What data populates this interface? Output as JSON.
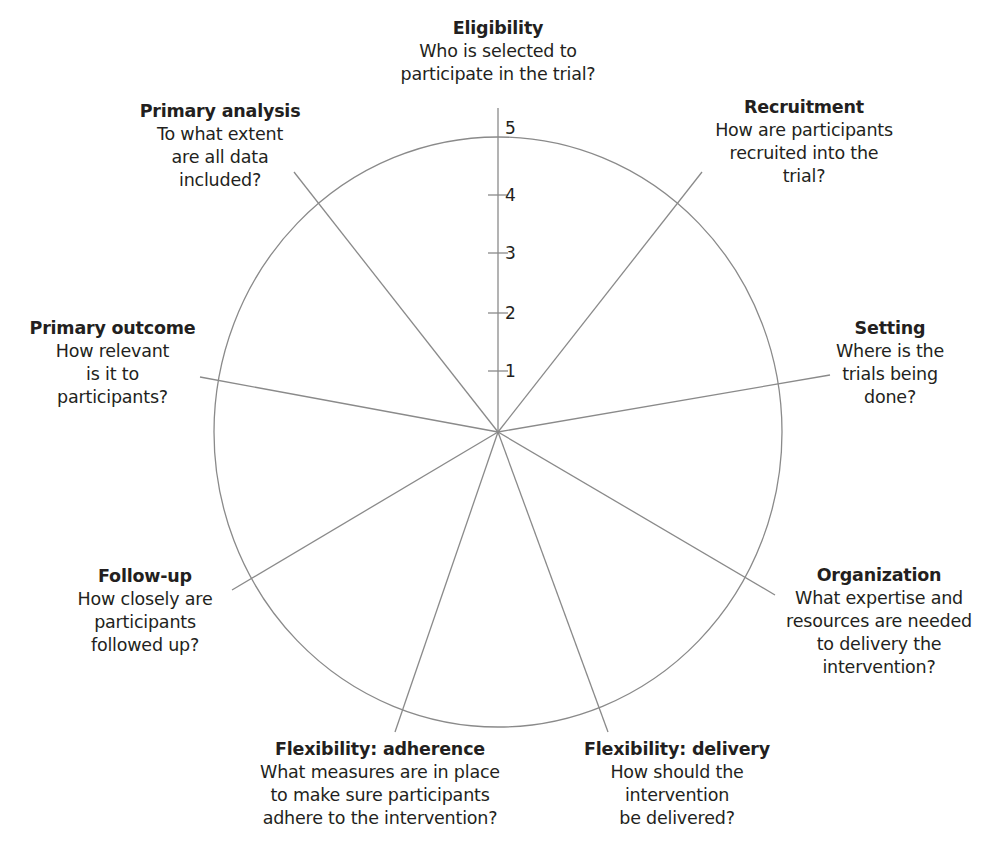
{
  "diagram": {
    "type": "wheel",
    "name": "PRECIS-2 wheel",
    "center": {
      "x": 498,
      "y": 432
    },
    "radius": {
      "rx": 284,
      "ry": 295
    },
    "line_color": "#8a8a8a",
    "text_color": "#231f20",
    "scale": {
      "ticks": [
        {
          "value": "1",
          "y": 371
        },
        {
          "value": "2",
          "y": 313
        },
        {
          "value": "3",
          "y": 253
        },
        {
          "value": "4",
          "y": 195
        },
        {
          "value": "5",
          "y": 128
        }
      ]
    },
    "domains": [
      {
        "title": "Eligibility",
        "question": "Who is selected to\nparticipate in the trial?",
        "spoke_end": {
          "x": 498,
          "y": 108
        }
      },
      {
        "title": "Recruitment",
        "question": "How are participants\nrecruited into the\ntrial?",
        "spoke_end": {
          "x": 702,
          "y": 172
        }
      },
      {
        "title": "Setting",
        "question": "Where is the\ntrials being\ndone?",
        "spoke_end": {
          "x": 830,
          "y": 375
        }
      },
      {
        "title": "Organization",
        "question": "What expertise and\nresources are needed\nto delivery the\nintervention?",
        "spoke_end": {
          "x": 775,
          "y": 595
        }
      },
      {
        "title": "Flexibility: delivery",
        "question": "How should the\nintervention\nbe delivered?",
        "spoke_end": {
          "x": 608,
          "y": 732
        }
      },
      {
        "title": "Flexibility: adherence",
        "question": "What measures are in place\nto make sure participants\nadhere to the intervention?",
        "spoke_end": {
          "x": 395,
          "y": 732
        }
      },
      {
        "title": "Follow-up",
        "question": "How closely are\nparticipants\nfollowed up?",
        "spoke_end": {
          "x": 232,
          "y": 590
        }
      },
      {
        "title": "Primary outcome",
        "question": "How relevant\nis it to\nparticipants?",
        "spoke_end": {
          "x": 200,
          "y": 377
        }
      },
      {
        "title": "Primary analysis",
        "question": "To what extent\nare all data\nincluded?",
        "spoke_end": {
          "x": 294,
          "y": 172
        }
      }
    ]
  }
}
